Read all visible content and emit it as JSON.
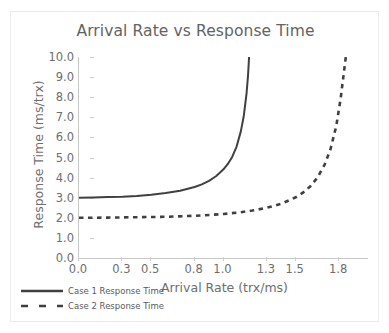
{
  "chart_data": {
    "type": "line",
    "title": "Arrival Rate vs Response Time",
    "xlabel": "Arrival Rate (trx/ms)",
    "ylabel": "Response Time (ms/trx)",
    "xlim": [
      0.0,
      2.0
    ],
    "ylim": [
      0.0,
      10.0
    ],
    "xticks": [
      "0.0",
      "0.3",
      "0.5",
      "0.8",
      "1.0",
      "1.3",
      "1.5",
      "1.8"
    ],
    "xtick_values": [
      0.0,
      0.3,
      0.5,
      0.8,
      1.0,
      1.3,
      1.5,
      1.8
    ],
    "yticks": [
      "0.0",
      "1.0",
      "2.0",
      "3.0",
      "4.0",
      "5.0",
      "6.0",
      "7.0",
      "8.0",
      "9.0",
      "10.0"
    ],
    "ytick_values": [
      0,
      1,
      2,
      3,
      4,
      5,
      6,
      7,
      8,
      9,
      10
    ],
    "grid": false,
    "legend_position": "bottom-left",
    "series": [
      {
        "name": "Case 1 Response Time",
        "style": "solid",
        "color": "#404040",
        "x": [
          0.0,
          0.1,
          0.2,
          0.3,
          0.4,
          0.5,
          0.6,
          0.7,
          0.8,
          0.85,
          0.9,
          0.95,
          1.0,
          1.03,
          1.06,
          1.09,
          1.12,
          1.14,
          1.16,
          1.17,
          1.18
        ],
        "y": [
          3.0,
          3.01,
          3.03,
          3.05,
          3.09,
          3.15,
          3.23,
          3.35,
          3.53,
          3.66,
          3.84,
          4.08,
          4.41,
          4.68,
          5.03,
          5.53,
          6.3,
          7.05,
          8.22,
          9.1,
          10.4
        ]
      },
      {
        "name": "Case 2 Response Time",
        "style": "dashed",
        "color": "#404040",
        "x": [
          0.0,
          0.2,
          0.4,
          0.6,
          0.8,
          0.9,
          1.0,
          1.1,
          1.2,
          1.3,
          1.4,
          1.5,
          1.55,
          1.6,
          1.65,
          1.7,
          1.74,
          1.78,
          1.81,
          1.83,
          1.85,
          1.86
        ],
        "y": [
          2.0,
          2.01,
          2.03,
          2.05,
          2.1,
          2.14,
          2.19,
          2.26,
          2.36,
          2.5,
          2.7,
          3.02,
          3.25,
          3.56,
          4.0,
          4.65,
          5.4,
          6.55,
          7.9,
          9.05,
          10.2,
          10.6
        ]
      }
    ]
  },
  "legend": {
    "items": [
      {
        "label": "Case 1 Response Time",
        "style": "solid"
      },
      {
        "label": "Case 2 Response Time",
        "style": "dashed"
      }
    ]
  }
}
